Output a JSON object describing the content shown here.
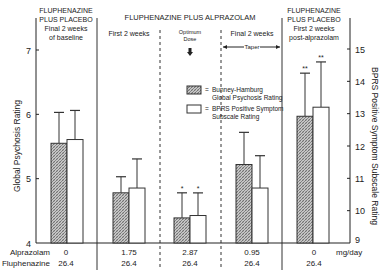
{
  "chart_data": {
    "type": "bar",
    "title": "",
    "phases": [
      {
        "lines": [
          "FLUPHENAZINE",
          "PLUS PLACEBO",
          "Final 2 weeks",
          "of baseline"
        ]
      },
      {
        "lines": [
          "First 2 weeks"
        ]
      },
      {
        "lines": [
          "Optimum",
          "Dose"
        ]
      },
      {
        "lines": [
          "Final 2 weeks"
        ],
        "sub": "Taper"
      },
      {
        "lines": [
          "FLUPHENAZINE",
          "PLUS PLACEBO",
          "First 2 weeks",
          "post-alprazolam"
        ]
      }
    ],
    "group_header": "FLUPHENAZINE PLUS ALPRAZOLAM",
    "categories": [
      "Baseline",
      "First 2 weeks",
      "Optimum Dose",
      "Taper",
      "Post-alprazolam"
    ],
    "alprazolam_mg_day": [
      "0",
      "1.75",
      "2.87",
      "0.95",
      "0"
    ],
    "fluphenazine_mg_day": [
      "26.4",
      "26.4",
      "26.4",
      "26.4",
      "26.4"
    ],
    "row_labels": {
      "alprazolam": "Alprazolam",
      "fluphenazine": "Fluphenazine",
      "unit": "mg/day"
    },
    "series": [
      {
        "name": "Bunney-Hamburg Global Psychosis Rating",
        "axis": "left",
        "fill": "hatched",
        "values": [
          5.55,
          4.78,
          4.39,
          5.22,
          5.97
        ],
        "error_upper": [
          6.03,
          5.03,
          4.78,
          5.72,
          6.64
        ],
        "markers": [
          "",
          "",
          "*",
          "",
          "**"
        ]
      },
      {
        "name": "BPRS Positive Symptom Subscale Rating",
        "axis": "right",
        "fill": "white",
        "values": [
          12.2,
          10.7,
          9.85,
          10.7,
          13.2
        ],
        "error_upper": [
          13.1,
          11.6,
          10.55,
          11.7,
          14.6
        ],
        "markers": [
          "",
          "",
          "*",
          "",
          "**"
        ]
      }
    ],
    "ylabel": "Global Psychosis Rating",
    "ylim": [
      4,
      7
    ],
    "yticks": [
      4,
      5,
      6,
      7
    ],
    "y2label": "BPRS Positive Symptom Subscale Rating",
    "y2lim": [
      9,
      15
    ],
    "y2ticks": [
      9,
      10,
      11,
      12,
      13,
      14,
      15
    ],
    "legend": [
      {
        "label_lines": [
          "Bunney-Hamburg",
          "Global Psychosis Rating"
        ],
        "fill": "hatched"
      },
      {
        "label_lines": [
          "BPRS Positive Symptom",
          "Subscale Rating"
        ],
        "fill": "white"
      }
    ],
    "legend_position": "upper-center",
    "grid": false
  }
}
